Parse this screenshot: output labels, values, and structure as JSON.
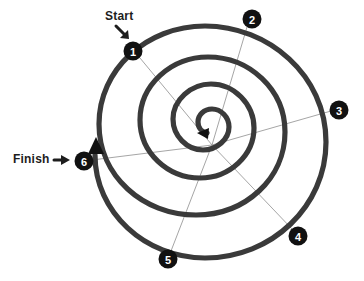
{
  "diagram": {
    "type": "spiral-diagram",
    "background_color": "#ffffff",
    "spiral_color": "#3a3a3a",
    "spoke_color": "#9b9b9b",
    "marker_fill": "#111111",
    "marker_text_color": "#ffffff",
    "label_color": "#1d1d1d",
    "center": {
      "x": 212,
      "y": 145
    },
    "turns": 3,
    "direction": "clockwise-inward"
  },
  "labels": {
    "start": {
      "text": "Start",
      "arrow_icon": "arrow-down-right-icon"
    },
    "finish": {
      "text": "Finish",
      "arrow_icon": "arrow-right-icon"
    }
  },
  "markers": [
    {
      "id": 1,
      "label": "1",
      "x": 133,
      "y": 51
    },
    {
      "id": 2,
      "label": "2",
      "x": 252,
      "y": 19
    },
    {
      "id": 3,
      "label": "3",
      "x": 339,
      "y": 110
    },
    {
      "id": 4,
      "label": "4",
      "x": 298,
      "y": 236
    },
    {
      "id": 5,
      "label": "5",
      "x": 168,
      "y": 259
    },
    {
      "id": 6,
      "label": "6",
      "x": 84,
      "y": 161
    }
  ],
  "arrowheads": [
    {
      "name": "center-arrowhead",
      "points_to": "spiral-center",
      "direction": "left"
    },
    {
      "name": "finish-arrowhead",
      "points_to": "spiral-outer-end",
      "direction": "up"
    }
  ]
}
